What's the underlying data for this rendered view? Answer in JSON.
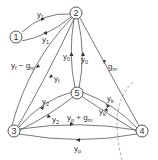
{
  "diagram": {
    "type": "admittance-graph",
    "nodes": [
      {
        "id": "1",
        "label": "1",
        "x": 16,
        "y": 37
      },
      {
        "id": "2",
        "label": "2",
        "x": 76,
        "y": 13
      },
      {
        "id": "3",
        "label": "3",
        "x": 14,
        "y": 131
      },
      {
        "id": "4",
        "label": "4",
        "x": 142,
        "y": 131
      },
      {
        "id": "5",
        "label": "5",
        "x": 77,
        "y": 93
      }
    ],
    "edges": [
      {
        "from": "1",
        "to": "2",
        "label": "y1",
        "display": "y₁"
      },
      {
        "from": "2",
        "to": "1",
        "label": "y1",
        "display": "y₁"
      },
      {
        "from": "3",
        "to": "2",
        "label": "yf - gm",
        "display": "y_f − g_m"
      },
      {
        "from": "2",
        "to": "3",
        "label": "yf",
        "display": "y_f"
      },
      {
        "from": "5",
        "to": "2",
        "label": "y0",
        "display": "y₀"
      },
      {
        "from": "2",
        "to": "5",
        "label": "y0",
        "display": "y₀"
      },
      {
        "from": "2",
        "to": "4",
        "label": "gm",
        "display": "g_m"
      },
      {
        "from": "5",
        "to": "3",
        "label": "y2",
        "display": "y₂"
      },
      {
        "from": "3",
        "to": "5",
        "label": "y2",
        "display": "y₂"
      },
      {
        "from": "5",
        "to": "4",
        "label": "yk",
        "display": "y_k"
      },
      {
        "from": "4",
        "to": "5",
        "label": "yk",
        "display": "y_k"
      },
      {
        "from": "3",
        "to": "4",
        "label": "yp + gm",
        "display": "y_p + g_m"
      },
      {
        "from": "4",
        "to": "3",
        "label": "yp",
        "display": "y_p"
      }
    ],
    "labels": {
      "n1": "1",
      "n2": "2",
      "n3": "3",
      "n4": "4",
      "n5": "5",
      "e12_top": "y",
      "e12_top_sub": "1",
      "e12_bot": "y",
      "e12_bot_sub": "1",
      "e23_outer": "y",
      "e23_outer_sub": "f",
      "e23_outer_rest": " − g",
      "e23_outer_rest_sub": "m",
      "e23_inner": "y",
      "e23_inner_sub": "f",
      "e25_left": "y",
      "e25_left_sub": "0",
      "e25_right": "y",
      "e25_right_sub": "0",
      "e24": "g",
      "e24_sub": "m",
      "e35_top": "y",
      "e35_top_sub": "2",
      "e35_bot": "y",
      "e35_bot_sub": "2",
      "e54_top": "y",
      "e54_top_sub": "k",
      "e54_bot": "y",
      "e54_bot_sub": "k",
      "e34_top": "y",
      "e34_top_sub": "p",
      "e34_top_rest": " + g",
      "e34_top_rest_sub": "m",
      "e34_bot": "y",
      "e34_bot_sub": "p"
    },
    "cutset": {
      "around_node": "4",
      "style": "dashed-arc"
    }
  }
}
